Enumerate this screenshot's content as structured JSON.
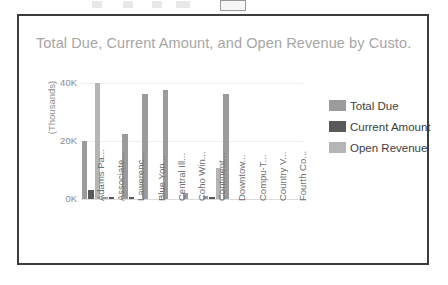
{
  "window": {
    "toolbar_visible": true
  },
  "chart_data": {
    "type": "bar",
    "title": "Total Due, Current Amount, and Open Revenue by Custo...",
    "xlabel": "",
    "ylabel": "(Thousands)",
    "ylim": [
      0,
      45000
    ],
    "ytick_labels": [
      "40K",
      "20K",
      "0K"
    ],
    "ytick_values": [
      40000,
      20000,
      0
    ],
    "grid": true,
    "legend_position": "right",
    "categories": [
      "Adams Pa...",
      "Associate...",
      "Lawerenc...",
      "Blue Yon...",
      "Central Ill...",
      "Coho Win...",
      "Continent...",
      "Downtow...",
      "Compu-T...",
      "Country V...",
      "Fourth Co..."
    ],
    "series": [
      {
        "name": "Total Due",
        "color": "#9b9b9b",
        "values": [
          20000,
          800,
          22500,
          36000,
          37500,
          2000,
          1200,
          36000,
          0,
          0,
          0
        ]
      },
      {
        "name": "Current Amount",
        "color": "#595959",
        "values": [
          3200,
          600,
          700,
          0,
          0,
          0,
          600,
          0,
          0,
          0,
          0
        ]
      },
      {
        "name": "Open Revenue",
        "color": "#b5b5b5",
        "values": [
          40000,
          0,
          0,
          0,
          0,
          0,
          10500,
          0,
          0,
          0,
          0
        ]
      }
    ]
  }
}
